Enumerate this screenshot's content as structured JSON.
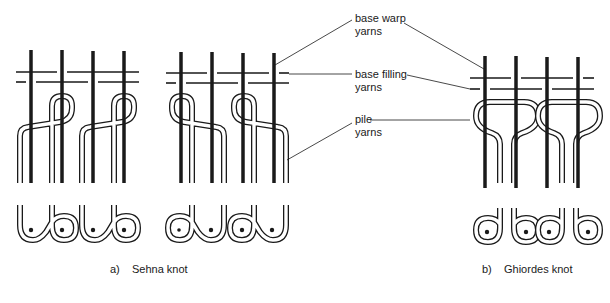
{
  "labels": {
    "warp": {
      "line1": "base warp",
      "line2": "yarns"
    },
    "filling": {
      "line1": "base filling",
      "line2": "yarns"
    },
    "pile": {
      "line1": "pile",
      "line2": "yarns"
    }
  },
  "captions": {
    "a": {
      "letter": "a)",
      "text": "Sehna knot"
    },
    "b": {
      "letter": "b)",
      "text": "Ghiordes knot"
    }
  },
  "colors": {
    "ink": "#1a1a1a",
    "paper": "#ffffff"
  }
}
